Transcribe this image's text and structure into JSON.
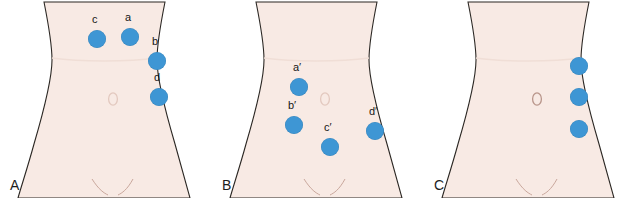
{
  "figure": {
    "type": "anatomical-diagram",
    "width": 636,
    "height": 198,
    "background_color": "#ffffff",
    "skin_fill_color": "#f8eae4",
    "outline_color": "#2b2723",
    "marker_color": "#3e96d4",
    "label_color": "#161616"
  },
  "watermark": {
    "line1": "",
    "line2": ""
  },
  "panels": [
    {
      "letter": "A",
      "name": "panel-a",
      "markers": [
        {
          "id": "c",
          "label": "c",
          "x": 88,
          "y": 30,
          "label_x": 92,
          "label_y": 14
        },
        {
          "id": "a",
          "label": "a",
          "x": 121,
          "y": 28,
          "label_x": 125,
          "label_y": 12
        },
        {
          "id": "b",
          "label": "b",
          "x": 148,
          "y": 52,
          "label_x": 152,
          "label_y": 36
        },
        {
          "id": "d",
          "label": "d",
          "x": 150,
          "y": 88,
          "label_x": 154,
          "label_y": 72
        }
      ]
    },
    {
      "letter": "B",
      "name": "panel-b",
      "markers": [
        {
          "id": "a-prime",
          "label": "a′",
          "x": 290,
          "y": 78,
          "label_x": 293,
          "label_y": 62
        },
        {
          "id": "b-prime",
          "label": "b′",
          "x": 285,
          "y": 116,
          "label_x": 288,
          "label_y": 100
        },
        {
          "id": "c-prime",
          "label": "c′",
          "x": 321,
          "y": 138,
          "label_x": 324,
          "label_y": 122
        },
        {
          "id": "d-prime",
          "label": "d′",
          "x": 366,
          "y": 122,
          "label_x": 369,
          "label_y": 106
        }
      ]
    },
    {
      "letter": "C",
      "name": "panel-c",
      "markers": [
        {
          "id": "c1",
          "label": "",
          "x": 570,
          "y": 57
        },
        {
          "id": "c2",
          "label": "",
          "x": 570,
          "y": 88
        },
        {
          "id": "c3",
          "label": "",
          "x": 570,
          "y": 120
        }
      ]
    }
  ]
}
